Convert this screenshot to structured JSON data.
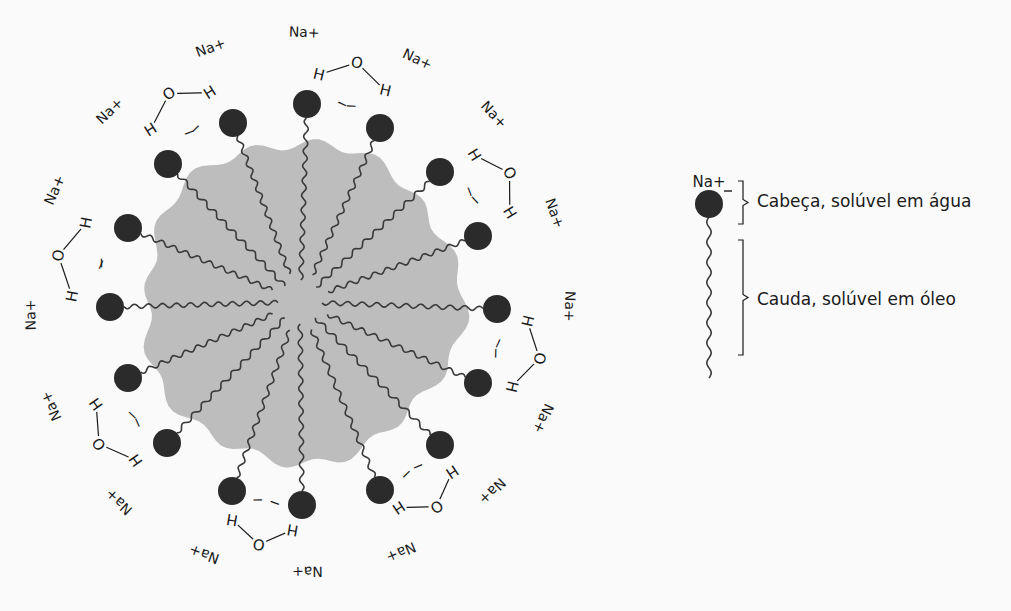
{
  "diagram": {
    "type": "micelle",
    "colors": {
      "background": "#fafafa",
      "core": "#bdbdbd",
      "head": "#2b2b2b",
      "ink": "#1a1a1a"
    },
    "micelle": {
      "center": [
        300,
        302
      ],
      "head_radius_px": 14,
      "heads": [
        {
          "x": 307,
          "y": 104,
          "charge": "−",
          "water": {
            "o": "O",
            "h1": "H",
            "h2": "H"
          },
          "ion": "Na+"
        },
        {
          "x": 380,
          "y": 128,
          "charge": "−",
          "ion": "Na+"
        },
        {
          "x": 440,
          "y": 172,
          "charge": "−",
          "ion": "Na+"
        },
        {
          "x": 478,
          "y": 236,
          "charge": "−",
          "ion": "Na+"
        },
        {
          "x": 497,
          "y": 309,
          "charge": "−",
          "ion": "Na+"
        },
        {
          "x": 478,
          "y": 383,
          "charge": "−",
          "ion": "Na+"
        },
        {
          "x": 440,
          "y": 445,
          "charge": "−",
          "ion": "Na+"
        },
        {
          "x": 380,
          "y": 490,
          "charge": "−",
          "ion": "Na+"
        },
        {
          "x": 302,
          "y": 505,
          "charge": "−",
          "ion": "Na+"
        },
        {
          "x": 232,
          "y": 491,
          "charge": "−",
          "ion": "Na+"
        },
        {
          "x": 167,
          "y": 443,
          "charge": "−",
          "ion": "Na+"
        },
        {
          "x": 128,
          "y": 378,
          "charge": "−",
          "ion": "Na+"
        },
        {
          "x": 110,
          "y": 307,
          "charge": "−",
          "ion": "Na+"
        },
        {
          "x": 128,
          "y": 228,
          "charge": "−",
          "ion": "Na+"
        },
        {
          "x": 168,
          "y": 164,
          "charge": "−",
          "ion": "Na+"
        },
        {
          "x": 233,
          "y": 123,
          "charge": "−",
          "ion": "Na+"
        }
      ],
      "sodium_label": "Na+",
      "water_labels": {
        "oxygen": "O",
        "hydrogen": "H"
      },
      "charge_label": "−"
    },
    "legend": {
      "ion_label": "Na+",
      "charge_label": "−",
      "head_label": "Cabeça, solúvel em água",
      "tail_label": "Cauda, solúvel em óleo"
    }
  }
}
